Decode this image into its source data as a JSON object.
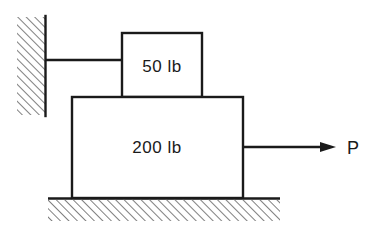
{
  "figure": {
    "type": "mechanics-free-body-diagram",
    "background_color": "#ffffff",
    "line_color": "#1a1a1a",
    "hatch_color": "#555555",
    "upper_block": {
      "label": "50 lb",
      "weight_value": 50,
      "weight_unit": "lb"
    },
    "lower_block": {
      "label": "200 lb",
      "weight_value": 200,
      "weight_unit": "lb"
    },
    "applied_force": {
      "label": "P",
      "direction": "right"
    },
    "wall": {
      "name": "wall",
      "hatch_direction": "up-right"
    },
    "ground": {
      "name": "ground",
      "hatch_direction": "up-right"
    },
    "connector": {
      "name": "cord-to-wall"
    }
  }
}
